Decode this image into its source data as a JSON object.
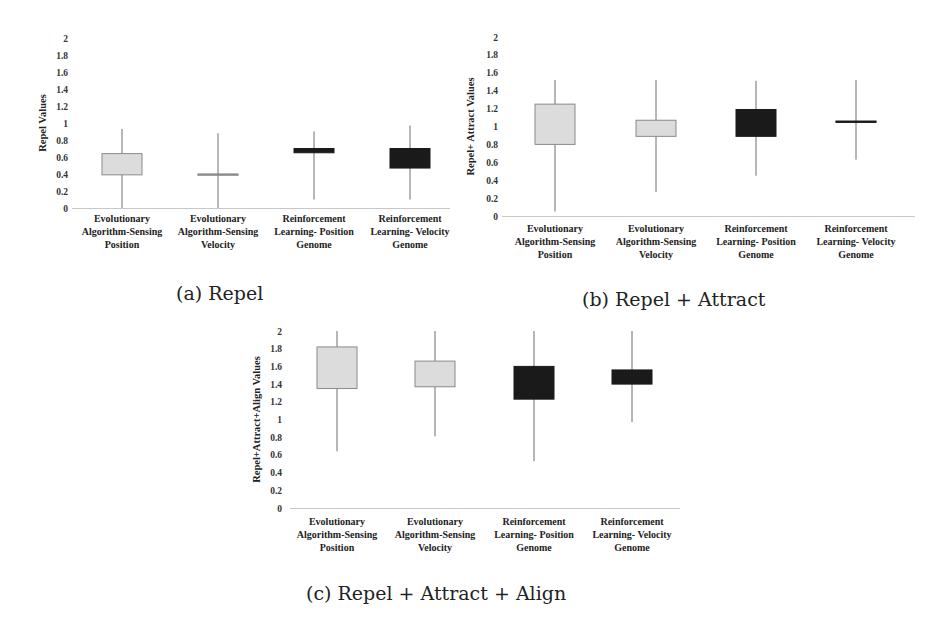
{
  "colors": {
    "light_box": "#dcdcdc",
    "light_box_stroke": "#8a8a8a",
    "dark_box": "#1a1a1a",
    "whisker": "#6e6e6e",
    "axis": "#c8c8c8",
    "text": "#222222"
  },
  "captions": {
    "a": "(a) Repel",
    "b": "(b) Repel + Attract",
    "c": "(c) Repel + Attract + Align"
  },
  "chart_data": [
    {
      "id": "a",
      "type": "boxplot",
      "title": "(a) Repel",
      "xlabel": "",
      "ylabel": "Repel Values",
      "ylim": [
        0,
        2
      ],
      "yticks": [
        "0",
        "0.2",
        "0.4",
        "0.6",
        "0.8",
        "1",
        "1.2",
        "1.4",
        "1.6",
        "1.8",
        "2"
      ],
      "grid": false,
      "legend": null,
      "categories": [
        [
          "Evolutionary",
          "Algorithm-Sensing",
          "Position"
        ],
        [
          "Evolutionary",
          "Algorithm-Sensing",
          "Velocity"
        ],
        [
          "Reinforcement",
          "Learning- Position",
          "Genome"
        ],
        [
          "Reinforcement",
          "Learning- Velocity",
          "Genome"
        ]
      ],
      "boxes": [
        {
          "min": 0.0,
          "q1": 0.39,
          "q3": 0.64,
          "max": 0.93,
          "fill": "light"
        },
        {
          "min": 0.0,
          "q1": 0.39,
          "q3": 0.4,
          "max": 0.88,
          "fill": "light"
        },
        {
          "min": 0.1,
          "q1": 0.65,
          "q3": 0.7,
          "max": 0.9,
          "fill": "dark"
        },
        {
          "min": 0.1,
          "q1": 0.47,
          "q3": 0.7,
          "max": 0.97,
          "fill": "dark"
        }
      ]
    },
    {
      "id": "b",
      "type": "boxplot",
      "title": "(b) Repel + Attract",
      "xlabel": "",
      "ylabel": "Repel+ Attract Values",
      "ylim": [
        0,
        2
      ],
      "yticks": [
        "0",
        "0.2",
        "0.4",
        "0.6",
        "0.8",
        "1",
        "1.2",
        "1.4",
        "1.6",
        "1.8",
        "2"
      ],
      "grid": false,
      "legend": null,
      "categories": [
        [
          "Evolutionary",
          "Algorithm-Sensing",
          "Position"
        ],
        [
          "Evolutionary",
          "Algorithm-Sensing",
          "Velocity"
        ],
        [
          "Reinforcement",
          "Learning- Position",
          "Genome"
        ],
        [
          "Reinforcement",
          "Learning- Velocity",
          "Genome"
        ]
      ],
      "boxes": [
        {
          "min": 0.05,
          "q1": 0.8,
          "q3": 1.25,
          "max": 1.52,
          "fill": "light"
        },
        {
          "min": 0.27,
          "q1": 0.89,
          "q3": 1.07,
          "max": 1.52,
          "fill": "light"
        },
        {
          "min": 0.45,
          "q1": 0.89,
          "q3": 1.19,
          "max": 1.51,
          "fill": "dark"
        },
        {
          "min": 0.63,
          "q1": 1.05,
          "q3": 1.06,
          "max": 1.52,
          "fill": "dark"
        }
      ]
    },
    {
      "id": "c",
      "type": "boxplot",
      "title": "(c) Repel + Attract + Align",
      "xlabel": "",
      "ylabel": "Repel+Attract+Align Values",
      "ylim": [
        0,
        2
      ],
      "yticks": [
        "0",
        "0.2",
        "0.4",
        "0.6",
        "0.8",
        "1",
        "1.2",
        "1.4",
        "1.6",
        "1.8",
        "2"
      ],
      "grid": false,
      "legend": null,
      "categories": [
        [
          "Evolutionary",
          "Algorithm-Sensing",
          "Position"
        ],
        [
          "Evolutionary",
          "Algorithm-Sensing",
          "Velocity"
        ],
        [
          "Reinforcement",
          "Learning- Position",
          "Genome"
        ],
        [
          "Reinforcement",
          "Learning- Velocity",
          "Genome"
        ]
      ],
      "boxes": [
        {
          "min": 0.64,
          "q1": 1.35,
          "q3": 1.82,
          "max": 2.0,
          "fill": "light"
        },
        {
          "min": 0.81,
          "q1": 1.37,
          "q3": 1.66,
          "max": 2.0,
          "fill": "light"
        },
        {
          "min": 0.53,
          "q1": 1.23,
          "q3": 1.6,
          "max": 2.0,
          "fill": "dark"
        },
        {
          "min": 0.97,
          "q1": 1.4,
          "q3": 1.56,
          "max": 2.0,
          "fill": "dark"
        }
      ]
    }
  ]
}
